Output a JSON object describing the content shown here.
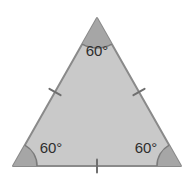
{
  "figure": {
    "name": "equilateral-triangle-diagram",
    "background_color": "#ffffff",
    "shape": {
      "type": "triangle",
      "fill_color": "#c9c9c9",
      "stroke_color": "#8a8a8a",
      "stroke_width": 2,
      "vertices": [
        {
          "name": "apex",
          "x": 97,
          "y": 18
        },
        {
          "name": "bottom-right",
          "x": 181,
          "y": 166
        },
        {
          "name": "bottom-left",
          "x": 13,
          "y": 166
        }
      ]
    },
    "angle_markers": {
      "sector_fill_color": "#a6a6a6",
      "arc_stroke_color": "#7a7a7a",
      "items": [
        {
          "id": "apex",
          "label": "60°",
          "vertex_x": 97,
          "vertex_y": 18,
          "radius": 30,
          "label_x": 97,
          "label_y": 56
        },
        {
          "id": "bottom-left",
          "label": "60°",
          "vertex_x": 13,
          "vertex_y": 166,
          "radius": 24,
          "label_x": 51,
          "label_y": 153
        },
        {
          "id": "bottom-right",
          "label": "60°",
          "vertex_x": 181,
          "vertex_y": 166,
          "radius": 24,
          "label_x": 146,
          "label_y": 153
        }
      ]
    },
    "tick_marks": {
      "stroke_color": "#6f6f6f",
      "stroke_width": 2,
      "count_per_side": 1,
      "items": [
        {
          "id": "left-side-tick",
          "cx": 55,
          "cy": 92
        },
        {
          "id": "right-side-tick",
          "cx": 139,
          "cy": 92
        },
        {
          "id": "bottom-side-tick",
          "cx": 97,
          "cy": 166
        }
      ]
    }
  }
}
